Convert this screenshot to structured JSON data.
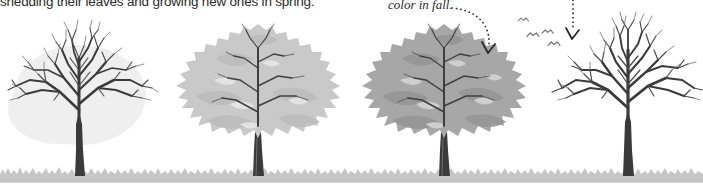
{
  "figure": {
    "caption_partial": "shedding their leaves and growing new ones in spring.",
    "annotation": "color in fall.",
    "background_color": "#ffffff",
    "ground": {
      "label": "grass-strip",
      "color": "#c6c6c6",
      "top_y": 168,
      "height": 13
    },
    "palette": {
      "branch_dark": "#3b3b3b",
      "branch_mid": "#555555",
      "canopy_light": "#c9c9c9",
      "canopy_light_shade": "#b6b6b6",
      "canopy_dark": "#a7a7a7",
      "canopy_dark_shade": "#949494",
      "trunk": "#3a3a3a",
      "text": "#2b2b2b",
      "leader_line": "#333333"
    },
    "trees": [
      {
        "id": "tree-1",
        "season": "spring-bare",
        "state": "bare branches, no leaves",
        "center_x": 80,
        "canopy_fill": "none",
        "trunk_top_y": 118,
        "ground_y": 175
      },
      {
        "id": "tree-2",
        "season": "summer",
        "state": "full light canopy",
        "center_x": 258,
        "canopy_fill": "#c9c9c9",
        "trunk_top_y": 128,
        "ground_y": 175
      },
      {
        "id": "tree-3",
        "season": "fall",
        "state": "full darker canopy, changing color",
        "center_x": 444,
        "canopy_fill": "#a7a7a7",
        "trunk_top_y": 128,
        "ground_y": 175
      },
      {
        "id": "tree-4",
        "season": "winter",
        "state": "bare branches, leaves dropped",
        "center_x": 628,
        "canopy_fill": "none",
        "trunk_top_y": 118,
        "ground_y": 175
      }
    ],
    "leader_lines": [
      {
        "id": "leader-to-fall-tree",
        "style": "dotted-curve-with-arrow",
        "from_x": 452,
        "from_y": 8,
        "to_x": 487,
        "to_y": 52,
        "points_to": "tree-3"
      },
      {
        "id": "leader-to-winter-tree",
        "style": "dotted-vertical-with-arrow",
        "from_x": 573,
        "from_y": 0,
        "to_x": 573,
        "to_y": 38,
        "points_to": "tree-4"
      }
    ],
    "birds": {
      "label": "flying-birds",
      "count": 4,
      "color": "#6e6e6e",
      "positions": [
        {
          "x": 523,
          "y": 22
        },
        {
          "x": 532,
          "y": 36
        },
        {
          "x": 546,
          "y": 33
        },
        {
          "x": 552,
          "y": 45
        }
      ]
    }
  }
}
